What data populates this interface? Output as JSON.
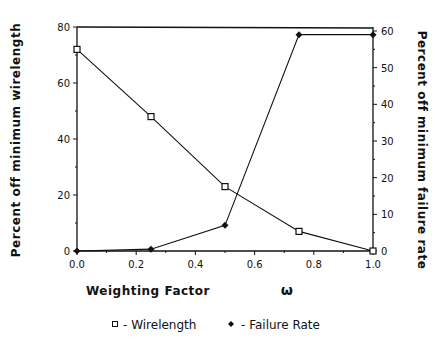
{
  "chart_data": {
    "type": "line",
    "title": "",
    "xlabel": "Weighting Factor",
    "xlabel_symbol": "ω",
    "ylabel_left": "Percent off minimum wirelength",
    "ylabel_right": "Percent off minimum failure rate",
    "x": [
      0.0,
      0.25,
      0.5,
      0.75,
      1.0
    ],
    "xlim": [
      0.0,
      1.0
    ],
    "xticks": [
      "0.0",
      "0.2",
      "0.4",
      "0.6",
      "0.8",
      "1.0"
    ],
    "ylim_left": [
      0,
      80
    ],
    "yticks_left": [
      "0",
      "20",
      "40",
      "60",
      "80"
    ],
    "ylim_right": [
      0,
      60
    ],
    "yticks_right": [
      "0",
      "10",
      "20",
      "30",
      "40",
      "50",
      "60"
    ],
    "grid": false,
    "legend_position": "bottom",
    "series": [
      {
        "name": "Wirelength",
        "marker": "open-square",
        "axis": "left",
        "values": [
          72,
          48,
          23,
          7,
          0
        ]
      },
      {
        "name": "Failure Rate",
        "marker": "filled-diamond",
        "axis": "right",
        "values": [
          0,
          0.5,
          7,
          59,
          59
        ]
      }
    ]
  },
  "legend": {
    "wirelength": "- Wirelength",
    "failure": "- Failure Rate"
  }
}
